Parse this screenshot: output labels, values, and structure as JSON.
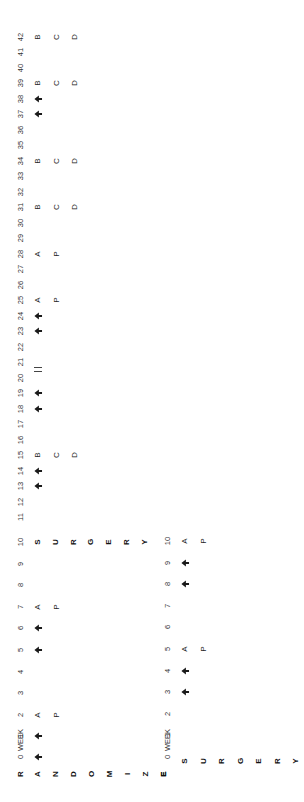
{
  "diagram": {
    "title_letters_upper": [
      "R",
      "A",
      "N",
      "D",
      "O",
      "M",
      "I",
      "Z",
      "E"
    ],
    "upper_timeline": {
      "axis_label": "WEEK",
      "weeks": [
        0,
        1,
        2,
        3,
        4,
        5,
        6,
        7,
        8,
        9,
        10,
        11,
        12,
        13,
        14,
        15,
        16,
        17,
        18,
        19,
        20,
        21,
        22,
        23,
        24,
        25,
        26,
        27,
        28,
        29,
        30,
        31,
        32,
        33,
        34,
        35,
        36,
        37,
        38,
        39,
        40,
        41,
        42
      ],
      "surgery_letters": [
        "S",
        "U",
        "R",
        "G",
        "E",
        "R",
        "Y"
      ],
      "surgery_week": 10,
      "arrow_weeks": [
        0,
        1,
        5,
        6,
        13,
        14,
        18,
        19,
        23,
        24,
        37,
        38
      ],
      "break_week": 20.5,
      "break_mark": "||",
      "events": [
        {
          "week": 2,
          "labels": [
            "A",
            "P"
          ]
        },
        {
          "week": 7,
          "labels": [
            "A",
            "P"
          ]
        },
        {
          "week": 15,
          "labels": [
            "B",
            "C",
            "D"
          ]
        },
        {
          "week": 25,
          "labels": [
            "A",
            "P"
          ]
        },
        {
          "week": 28,
          "labels": [
            "A",
            "P"
          ]
        },
        {
          "week": 31,
          "labels": [
            "B",
            "C",
            "D"
          ]
        },
        {
          "week": 34,
          "labels": [
            "B",
            "C",
            "D"
          ]
        },
        {
          "week": 39,
          "labels": [
            "B",
            "C",
            "D"
          ]
        },
        {
          "week": 42,
          "labels": [
            "B",
            "C",
            "D"
          ]
        }
      ]
    },
    "lower_timeline": {
      "axis_label": "WEEK",
      "weeks": [
        0,
        1,
        2,
        3,
        4,
        5,
        6,
        7,
        8,
        9,
        10
      ],
      "surgery_letters": [
        "S",
        "U",
        "R",
        "G",
        "E",
        "R",
        "Y"
      ],
      "surgery_week": 0,
      "arrow_weeks": [
        3,
        4,
        8,
        9
      ],
      "events": [
        {
          "week": 5,
          "labels": [
            "A",
            "P"
          ]
        },
        {
          "week": 10,
          "labels": [
            "A",
            "P"
          ]
        }
      ]
    },
    "legend_letters": {
      "arrow": "treatment marker",
      "A": "A",
      "P": "P",
      "B": "B",
      "C": "C",
      "D": "D"
    }
  }
}
